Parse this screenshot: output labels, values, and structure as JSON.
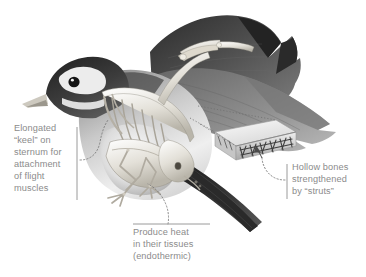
{
  "figure": {
    "background_color": "#ffffff",
    "ink_color": "#3a3a3a",
    "rule_color": "#9a9a9a",
    "text_color": "#8b8b8b",
    "leader_color": "#7d7d7d"
  },
  "annotations": [
    {
      "id": "keel",
      "text": "Elongated\n“keel” on\nsternum for\nattachment\nof flight\nmuscles",
      "rule": "vertical",
      "leader": "dotted-curve-right"
    },
    {
      "id": "struts",
      "text": "Hollow bones\nstrengthened\nby “struts”",
      "rule": "vertical",
      "leader": "dotted-curve-left-with-arrow"
    },
    {
      "id": "heat",
      "text": "Produce heat\nin their tissues\n(endothermic)",
      "rule": "horizontal",
      "leader": "dotted-curve-up"
    }
  ],
  "inset": {
    "id": "bone-cross-section",
    "description": "cut-away hollow bone showing internal struts"
  }
}
